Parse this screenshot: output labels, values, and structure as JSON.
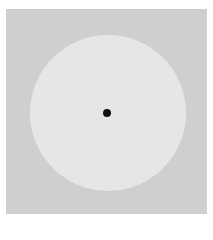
{
  "stimulus": {
    "background_color": "#ffffff",
    "surround_color": "#cfcfcf",
    "disc_color": "#e6e6e6",
    "fixation_dot_color": "#111111",
    "shapes": [
      "gray-square-surround",
      "light-disc",
      "fixation-dot"
    ]
  }
}
